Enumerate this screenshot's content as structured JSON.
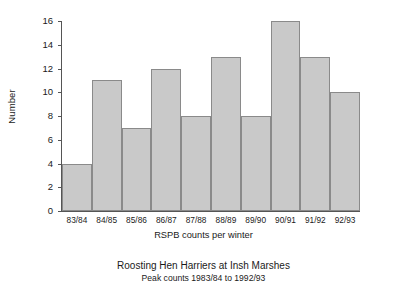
{
  "chart_data": {
    "type": "bar",
    "title": "Roosting Hen Harriers at Insh Marshes",
    "subtitle": "Peak counts 1983/84 to 1992/93",
    "xlabel": "RSPB counts per winter",
    "ylabel": "Number",
    "categories": [
      "83/84",
      "84/85",
      "85/86",
      "86/87",
      "87/88",
      "88/89",
      "89/90",
      "90/91",
      "91/92",
      "92/93"
    ],
    "values": [
      4,
      11,
      7,
      12,
      8,
      13,
      8,
      16,
      13,
      10
    ],
    "ylim": [
      0,
      16
    ],
    "ytick_labels": [
      "0",
      "2",
      "4",
      "6",
      "8",
      "10",
      "12",
      "14",
      "16"
    ],
    "ytick_values": [
      0,
      2,
      4,
      6,
      8,
      10,
      12,
      14,
      16
    ],
    "grid": false,
    "legend": "none",
    "bar_fill_color": "#c9c9c9",
    "bar_edge_color": "#8a8a8a",
    "axis_color": "#555555",
    "text_color": "#1a1a1a",
    "background_color": "#ffffff"
  }
}
